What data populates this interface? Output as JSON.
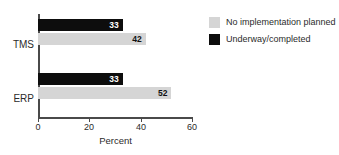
{
  "chart_data": {
    "type": "bar",
    "orientation": "horizontal",
    "title": "",
    "xlabel": "Percent",
    "ylabel": "",
    "categories": [
      "TMS",
      "ERP"
    ],
    "series": [
      {
        "name": "Underway/completed",
        "color": "#0d0d0d",
        "values": [
          33,
          33
        ]
      },
      {
        "name": "No implementation planned",
        "color": "#d5d5d5",
        "values": [
          42,
          52
        ]
      }
    ],
    "xlim": [
      0,
      60
    ],
    "xticks": [
      0,
      20,
      40,
      60
    ],
    "xtick_labels": [
      "0",
      "20",
      "40",
      "60"
    ],
    "grid": false,
    "legend_position": "top-right",
    "data_labels": true
  },
  "axis": {
    "x_title": "Percent",
    "ticks": [
      {
        "value": 0,
        "label": "0"
      },
      {
        "value": 20,
        "label": "20"
      },
      {
        "value": 40,
        "label": "40"
      },
      {
        "value": 60,
        "label": "60"
      }
    ]
  },
  "categories": [
    {
      "label": "TMS",
      "dark_value": "33",
      "light_value": "42"
    },
    {
      "label": "ERP",
      "dark_value": "33",
      "light_value": "52"
    }
  ],
  "legend": {
    "items": [
      {
        "label": "No implementation planned",
        "color": "#d5d5d5"
      },
      {
        "label": "Underway/completed",
        "color": "#0d0d0d"
      }
    ]
  },
  "colors": {
    "dark_series": "#0d0d0d",
    "light_series": "#d5d5d5",
    "axis": "#4a4a4a",
    "text": "#2b2b2b",
    "background": "#ffffff"
  }
}
